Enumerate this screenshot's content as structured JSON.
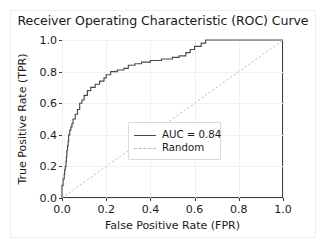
{
  "chart_data": {
    "type": "line",
    "title": "Receiver Operating Characteristic (ROC) Curve",
    "xlabel": "False Positive Rate (FPR)",
    "ylabel": "True Positive Rate (TPR)",
    "xlim": [
      0.0,
      1.0
    ],
    "ylim": [
      0.0,
      1.0
    ],
    "xticks": [
      "0.0",
      "0.2",
      "0.4",
      "0.6",
      "0.8",
      "1.0"
    ],
    "xtick_values": [
      0.0,
      0.2,
      0.4,
      0.6,
      0.8,
      1.0
    ],
    "yticks": [
      "0.0",
      "0.2",
      "0.4",
      "0.6",
      "0.8",
      "1.0"
    ],
    "ytick_values": [
      0.0,
      0.2,
      0.4,
      0.6,
      0.8,
      1.0
    ],
    "grid": true,
    "legend_position": "lower right",
    "auc": 0.84,
    "series": [
      {
        "name": "AUC = 0.84",
        "style": "solid",
        "color": "#4a4a4a",
        "x": [
          0.0,
          0.0,
          0.0,
          0.005,
          0.005,
          0.01,
          0.01,
          0.012,
          0.012,
          0.015,
          0.015,
          0.018,
          0.018,
          0.02,
          0.02,
          0.022,
          0.022,
          0.025,
          0.025,
          0.028,
          0.028,
          0.03,
          0.03,
          0.035,
          0.035,
          0.04,
          0.04,
          0.045,
          0.045,
          0.05,
          0.05,
          0.06,
          0.06,
          0.07,
          0.07,
          0.08,
          0.08,
          0.09,
          0.09,
          0.1,
          0.1,
          0.115,
          0.115,
          0.13,
          0.13,
          0.15,
          0.15,
          0.17,
          0.17,
          0.19,
          0.19,
          0.2,
          0.2,
          0.22,
          0.22,
          0.25,
          0.25,
          0.28,
          0.28,
          0.3,
          0.3,
          0.33,
          0.33,
          0.36,
          0.36,
          0.4,
          0.4,
          0.45,
          0.45,
          0.5,
          0.5,
          0.53,
          0.53,
          0.56,
          0.56,
          0.58,
          0.58,
          0.6,
          0.6,
          0.63,
          0.63,
          0.65,
          0.65,
          1.0
        ],
        "y": [
          0.0,
          0.04,
          0.08,
          0.08,
          0.12,
          0.12,
          0.15,
          0.15,
          0.18,
          0.18,
          0.2,
          0.2,
          0.23,
          0.23,
          0.26,
          0.26,
          0.3,
          0.3,
          0.33,
          0.33,
          0.36,
          0.36,
          0.4,
          0.4,
          0.43,
          0.43,
          0.45,
          0.45,
          0.47,
          0.47,
          0.5,
          0.5,
          0.53,
          0.53,
          0.56,
          0.56,
          0.6,
          0.6,
          0.62,
          0.62,
          0.65,
          0.65,
          0.68,
          0.68,
          0.7,
          0.7,
          0.72,
          0.72,
          0.74,
          0.74,
          0.76,
          0.76,
          0.78,
          0.78,
          0.8,
          0.8,
          0.81,
          0.81,
          0.82,
          0.82,
          0.84,
          0.84,
          0.85,
          0.85,
          0.86,
          0.86,
          0.87,
          0.87,
          0.88,
          0.88,
          0.89,
          0.89,
          0.9,
          0.9,
          0.92,
          0.92,
          0.94,
          0.94,
          0.96,
          0.96,
          0.98,
          0.98,
          1.0,
          1.0
        ]
      },
      {
        "name": "Random",
        "style": "dashed",
        "color": "#b9bbbd",
        "x": [
          0.0,
          1.0
        ],
        "y": [
          0.0,
          1.0
        ]
      }
    ]
  },
  "legend": {
    "items": [
      {
        "label": "AUC = 0.84"
      },
      {
        "label": "Random"
      }
    ]
  }
}
